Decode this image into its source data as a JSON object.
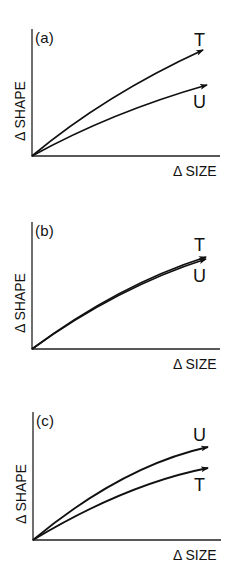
{
  "chart_data": [
    {
      "type": "line",
      "panel": "(a)",
      "xlabel": "Δ SIZE",
      "ylabel": "Δ SHAPE",
      "grid": false,
      "axis_ticks": false,
      "xlim": [
        0,
        1
      ],
      "ylim": [
        0,
        1
      ],
      "series": [
        {
          "name": "T",
          "x": [
            0,
            0.47,
            0.91
          ],
          "y": [
            0,
            0.48,
            0.83
          ],
          "arrow_end": true
        },
        {
          "name": "U",
          "x": [
            0,
            0.47,
            0.93
          ],
          "y": [
            0,
            0.32,
            0.56
          ],
          "arrow_end": true
        }
      ]
    },
    {
      "type": "line",
      "panel": "(b)",
      "xlabel": "Δ SIZE",
      "ylabel": "Δ SHAPE",
      "grid": false,
      "axis_ticks": false,
      "xlim": [
        0,
        1
      ],
      "ylim": [
        0,
        1
      ],
      "series": [
        {
          "name": "T",
          "x": [
            0,
            0.36,
            0.93
          ],
          "y": [
            0,
            0.39,
            0.72
          ],
          "arrow_end": true
        },
        {
          "name": "U",
          "x": [
            0,
            0.36,
            0.93
          ],
          "y": [
            0,
            0.385,
            0.715
          ],
          "arrow_end": true
        }
      ]
    },
    {
      "type": "line",
      "panel": "(c)",
      "xlabel": "Δ SIZE",
      "ylabel": "Δ SHAPE",
      "grid": false,
      "axis_ticks": false,
      "xlim": [
        0,
        1
      ],
      "ylim": [
        0,
        1
      ],
      "series": [
        {
          "name": "U",
          "x": [
            0,
            0.46,
            0.93
          ],
          "y": [
            0,
            0.45,
            0.73
          ],
          "arrow_end": true
        },
        {
          "name": "T",
          "x": [
            0,
            0.46,
            0.93
          ],
          "y": [
            0,
            0.35,
            0.56
          ],
          "arrow_end": true
        }
      ]
    }
  ],
  "panels": [
    {
      "letter": "(a)",
      "xlabel": "Δ SIZE",
      "ylabel": "Δ SHAPE",
      "top_label": "T",
      "bottom_label": "U",
      "axes": {
        "ox": 32,
        "oy": 156,
        "top": 29,
        "right": 220
      },
      "curves": [
        {
          "name": "T",
          "ex": 203,
          "ey": 50,
          "cx": 105,
          "cy": 95
        },
        {
          "name": "U",
          "ex": 207,
          "ey": 85,
          "cx": 112,
          "cy": 112
        }
      ],
      "color": "#111111"
    },
    {
      "letter": "(b)",
      "xlabel": "Δ SIZE",
      "ylabel": "Δ SHAPE",
      "top_label": "T",
      "bottom_label": "U",
      "axes": {
        "ox": 32,
        "oy": 349,
        "top": 222,
        "right": 220
      },
      "curves": [
        {
          "name": "T",
          "ex": 206,
          "ey": 257,
          "cx": 118,
          "cy": 285
        },
        {
          "name": "U",
          "ex": 206,
          "ey": 259,
          "cx": 118,
          "cy": 287
        }
      ],
      "color": "#111111"
    },
    {
      "letter": "(c)",
      "xlabel": "Δ SIZE",
      "ylabel": "Δ SHAPE",
      "top_label": "U",
      "bottom_label": "T",
      "axes": {
        "ox": 33,
        "oy": 540,
        "top": 412,
        "right": 221
      },
      "curves": [
        {
          "name": "U",
          "ex": 208,
          "ey": 447,
          "cx": 122,
          "cy": 466
        },
        {
          "name": "T",
          "ex": 208,
          "ey": 468,
          "cx": 126,
          "cy": 484
        }
      ],
      "color": "#111111"
    }
  ]
}
